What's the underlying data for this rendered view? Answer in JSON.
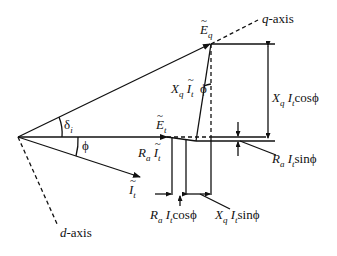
{
  "diagram": {
    "colors": {
      "line": "#111111",
      "background": "#ffffff"
    },
    "axes": {
      "q_axis": {
        "var": "q",
        "suffix": "-axis"
      },
      "d_axis": {
        "var": "d",
        "suffix": "-axis"
      }
    },
    "phasors": {
      "Eq": {
        "main": "E",
        "sub": "q"
      },
      "Et": {
        "main": "E",
        "sub": "t"
      },
      "It": {
        "main": "I",
        "sub": "t"
      }
    },
    "angles": {
      "delta": {
        "main": "δ",
        "sub": "i"
      },
      "phi_origin": "ϕ",
      "phi_top": "ϕ"
    },
    "drops": {
      "XqIt": {
        "X": "X",
        "Xsub": "q",
        "I": "I",
        "Isub": "t"
      },
      "RaIt": {
        "R": "R",
        "Rsub": "a",
        "I": "I",
        "Isub": "t"
      }
    },
    "dimensions": {
      "XqItcos": {
        "X": "X",
        "Xsub": "q",
        "I": "I",
        "Isub": "t",
        "fn": "cosϕ"
      },
      "RaItsin": {
        "R": "R",
        "Rsub": "a",
        "I": "I",
        "Isub": "t",
        "fn": "sinϕ"
      },
      "RaItcos": {
        "R": "R",
        "Rsub": "a",
        "I": "I",
        "Isub": "t",
        "fn": "cosϕ"
      },
      "XqItsin": {
        "X": "X",
        "Xsub": "q",
        "I": "I",
        "Isub": "t",
        "fn": "sinϕ"
      }
    }
  }
}
